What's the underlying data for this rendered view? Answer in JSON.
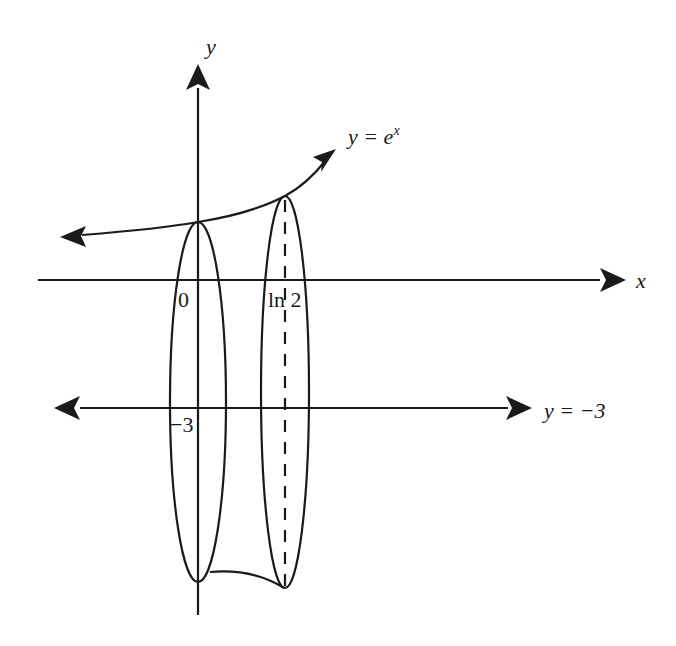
{
  "diagram": {
    "colors": {
      "ink": "#1a1a1a",
      "background": "#ffffff"
    },
    "axes": {
      "x_label": "x",
      "y_label": "y"
    },
    "curve": {
      "label_prefix": "y = e",
      "label_exponent": "x"
    },
    "axis_of_rotation": {
      "label": "y = −3"
    },
    "tick_labels": {
      "origin": "0",
      "ln2": "ln 2",
      "minus3": "−3"
    },
    "disks": [
      {
        "name": "disk-at-x-0",
        "x_value": "0"
      },
      {
        "name": "disk-at-x-ln2",
        "x_value": "ln 2"
      }
    ]
  }
}
